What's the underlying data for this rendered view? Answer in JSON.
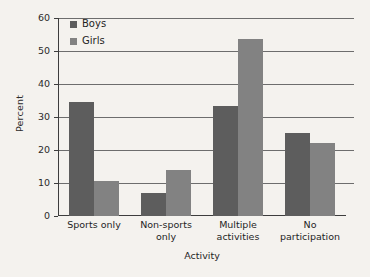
{
  "chart_data": {
    "type": "bar",
    "title": "",
    "subtitle": "",
    "xlabel": "Activity",
    "ylabel": "Percent",
    "categories": [
      "Sports only",
      "Non-sports only",
      "Multiple activities",
      "No participation"
    ],
    "category_lines": [
      [
        "Sports only"
      ],
      [
        "Non-sports",
        "only"
      ],
      [
        "Multiple",
        "activities"
      ],
      [
        "No",
        "participation"
      ]
    ],
    "series": [
      {
        "name": "Boys",
        "color": "#5d5d5d",
        "values": [
          34.5,
          7.0,
          33.3,
          25.3
        ]
      },
      {
        "name": "Girls",
        "color": "#828282",
        "values": [
          10.5,
          14.0,
          53.5,
          22.2
        ]
      }
    ],
    "ylim": [
      0,
      60
    ],
    "yticks": [
      0,
      10,
      20,
      30,
      40,
      50,
      60
    ],
    "ytick_labels": [
      "0",
      "10",
      "20",
      "30",
      "40",
      "50",
      "60"
    ],
    "grid": true,
    "grid_axis": "y",
    "legend_position": "top-left-inside",
    "background_color": "#f4f2ee",
    "axis_color": "#3d3d3d",
    "gridline_color": "#6d6d6d"
  }
}
